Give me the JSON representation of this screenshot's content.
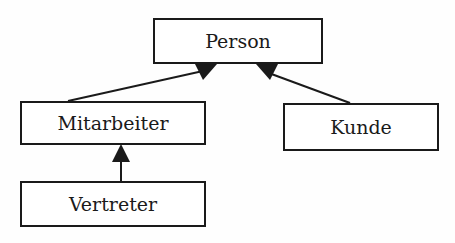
{
  "diagram": {
    "type": "class-inheritance",
    "nodes": {
      "person": {
        "label": "Person"
      },
      "mitarbeiter": {
        "label": "Mitarbeiter"
      },
      "kunde": {
        "label": "Kunde"
      },
      "vertreter": {
        "label": "Vertreter"
      }
    },
    "edges": [
      {
        "from": "Mitarbeiter",
        "to": "Person",
        "arrow": "filled-triangle"
      },
      {
        "from": "Kunde",
        "to": "Person",
        "arrow": "filled-triangle"
      },
      {
        "from": "Vertreter",
        "to": "Mitarbeiter",
        "arrow": "filled-triangle"
      }
    ],
    "colors": {
      "stroke": "#1a1a1a",
      "background": "#fefefe"
    }
  }
}
